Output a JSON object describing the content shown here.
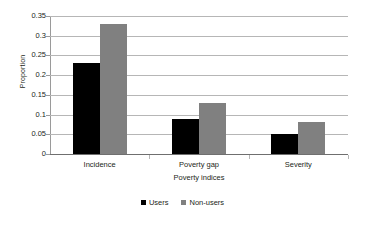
{
  "chart_data": {
    "type": "bar",
    "title": "",
    "subtitle": "",
    "xlabel": "Poverty indices",
    "ylabel": "Proportion",
    "categories": [
      "Incidence",
      "Poverty gap",
      "Severity"
    ],
    "series": [
      {
        "name": "Users",
        "color": "#000000",
        "values": [
          0.23,
          0.09,
          0.05
        ]
      },
      {
        "name": "Non-users",
        "color": "#808080",
        "values": [
          0.33,
          0.13,
          0.08
        ]
      }
    ],
    "ylim": [
      0,
      0.35
    ],
    "ytick_step": 0.05,
    "ytick_labels": [
      "0",
      "0.05",
      "0.1",
      "0.15",
      "0.2",
      "0.25",
      "0.3",
      "0.35"
    ],
    "ytick_values": [
      0,
      0.05,
      0.1,
      0.15,
      0.2,
      0.25,
      0.3,
      0.35
    ],
    "grid": true,
    "grid_axis": "y",
    "grid_color": "#b6b6b6",
    "legend_position": "bottom-center",
    "background": "#ffffff"
  }
}
